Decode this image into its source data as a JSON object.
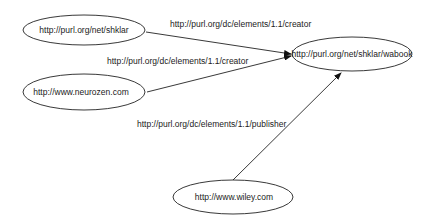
{
  "diagram": {
    "type": "rdf-graph",
    "nodes": [
      {
        "id": "shklar",
        "label": "http://purl.org/net/shklar"
      },
      {
        "id": "neurozen",
        "label": "http://www.neurozen.com"
      },
      {
        "id": "wabook",
        "label": "http://purl.org/net/shklar/wabook"
      },
      {
        "id": "wiley",
        "label": "http://www.wiley.com"
      }
    ],
    "edges": [
      {
        "from": "shklar",
        "to": "wabook",
        "label": "http://purl.org/dc/elements/1.1/creator"
      },
      {
        "from": "neurozen",
        "to": "wabook",
        "label": "http://purl.org/dc/elements/1.1/creator"
      },
      {
        "from": "wiley",
        "to": "wabook",
        "label": "http://purl.org/dc/elements/1.1/publisher"
      }
    ],
    "colors": {
      "stroke": "#222222",
      "background": "#ffffff"
    }
  }
}
